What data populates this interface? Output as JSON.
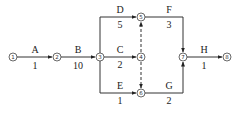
{
  "diagram": {
    "type": "activity-on-arrow network",
    "nodes": [
      {
        "id": "1",
        "glyph": "①",
        "x": 13,
        "y": 57
      },
      {
        "id": "2",
        "glyph": "②",
        "x": 57,
        "y": 57
      },
      {
        "id": "3",
        "glyph": "③",
        "x": 100,
        "y": 57
      },
      {
        "id": "4",
        "glyph": "④",
        "x": 141,
        "y": 57
      },
      {
        "id": "5",
        "glyph": "⑤",
        "x": 141,
        "y": 17
      },
      {
        "id": "6",
        "glyph": "⑥",
        "x": 141,
        "y": 93
      },
      {
        "id": "7",
        "glyph": "⑦",
        "x": 183,
        "y": 57
      },
      {
        "id": "8",
        "glyph": "⑧",
        "x": 227,
        "y": 57
      }
    ],
    "activities": [
      {
        "name": "A",
        "duration": "1",
        "from": "1",
        "to": "2"
      },
      {
        "name": "B",
        "duration": "10",
        "from": "2",
        "to": "3"
      },
      {
        "name": "D",
        "duration": "5",
        "from": "3",
        "to": "5"
      },
      {
        "name": "C",
        "duration": "2",
        "from": "3",
        "to": "4"
      },
      {
        "name": "E",
        "duration": "1",
        "from": "3",
        "to": "6"
      },
      {
        "name": "F",
        "duration": "3",
        "from": "5",
        "to": "7"
      },
      {
        "name": "G",
        "duration": "2",
        "from": "6",
        "to": "7"
      },
      {
        "name": "H",
        "duration": "1",
        "from": "7",
        "to": "8"
      }
    ],
    "dummies": [
      {
        "from": "4",
        "to": "5",
        "style": "dashed"
      },
      {
        "from": "4",
        "to": "6",
        "style": "dashed"
      }
    ]
  }
}
